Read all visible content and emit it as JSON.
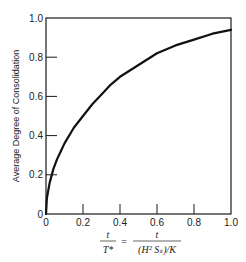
{
  "chart_data": {
    "type": "line",
    "title": "",
    "xlabel": "t / T* = t / ((H^2 S_s)/K)",
    "ylabel": "Average Degree of Consolidation",
    "xlim": [
      0,
      1.0
    ],
    "ylim": [
      0,
      1.0
    ],
    "grid": false,
    "legend": null,
    "x_ticks": [
      "0",
      "0.2",
      "0.4",
      "0.6",
      "0.8",
      "1.0"
    ],
    "y_ticks": [
      "0",
      "0.2",
      "0.4",
      "0.6",
      "0.8",
      "1.0"
    ],
    "series": [
      {
        "name": "Average Degree of Consolidation",
        "x": [
          0,
          0.005,
          0.01,
          0.02,
          0.04,
          0.06,
          0.08,
          0.1,
          0.15,
          0.2,
          0.25,
          0.3,
          0.35,
          0.4,
          0.5,
          0.6,
          0.7,
          0.8,
          0.9,
          1.0
        ],
        "y": [
          0,
          0.08,
          0.11,
          0.16,
          0.23,
          0.28,
          0.32,
          0.36,
          0.44,
          0.5,
          0.56,
          0.61,
          0.66,
          0.7,
          0.76,
          0.82,
          0.86,
          0.89,
          0.92,
          0.94
        ]
      }
    ]
  },
  "axes": {
    "y_title": "Average Degree of Consolidation",
    "x_title": {
      "lhs_num": "t",
      "lhs_den": "T*",
      "equals": "=",
      "rhs_num": "t",
      "rhs_den": "(H² Sₛ)/K"
    }
  }
}
